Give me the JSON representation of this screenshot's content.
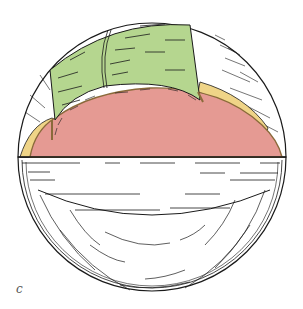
{
  "figure": {
    "panel_label": "c",
    "regions": [
      {
        "name": "green-layer",
        "color": "#b5d68f"
      },
      {
        "name": "pink-core",
        "color": "#e59a93"
      },
      {
        "name": "yellow-band",
        "color": "#efd487"
      },
      {
        "name": "stippled-cap",
        "color": "#ffffff"
      },
      {
        "name": "lower-hemisphere",
        "color": "#ffffff"
      }
    ],
    "colors": {
      "outline": "#1a1a1a",
      "green": "#b5d68f",
      "pink": "#e59a93",
      "yellow": "#efd487",
      "brown_edge": "#8a6a3a"
    }
  }
}
